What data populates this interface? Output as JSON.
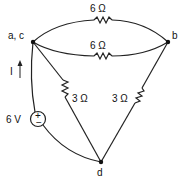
{
  "diagram": {
    "type": "circuit",
    "nodes": [
      {
        "id": "ac",
        "label": "a, c"
      },
      {
        "id": "b",
        "label": "b"
      },
      {
        "id": "d",
        "label": "d"
      }
    ],
    "components": [
      {
        "id": "r_top",
        "type": "resistor",
        "value": "6 Ω",
        "from": "ac",
        "to": "b"
      },
      {
        "id": "r_mid",
        "type": "resistor",
        "value": "6 Ω",
        "from": "ac",
        "to": "b"
      },
      {
        "id": "r_left",
        "type": "resistor",
        "value": "3 Ω",
        "from": "ac",
        "to": "d"
      },
      {
        "id": "r_right",
        "type": "resistor",
        "value": "3 Ω",
        "from": "b",
        "to": "d"
      },
      {
        "id": "v_src",
        "type": "voltage_source",
        "value": "6 V",
        "from": "d",
        "to": "ac",
        "plus": "+",
        "minus": "−"
      }
    ],
    "current": {
      "label": "I",
      "direction": "up"
    }
  }
}
